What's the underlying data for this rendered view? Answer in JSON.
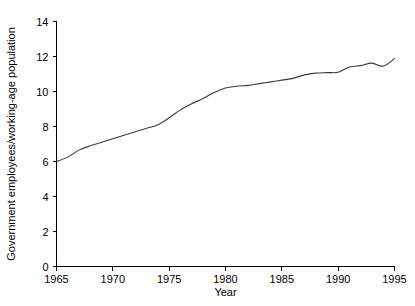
{
  "chart_data": {
    "type": "line",
    "title": "",
    "subtitle": "",
    "xlabel": "Year",
    "ylabel": "Government employees/working-age population",
    "xlim": [
      1965,
      1995
    ],
    "ylim": [
      0,
      14
    ],
    "xticks": [
      1965,
      1970,
      1975,
      1980,
      1985,
      1990,
      1995
    ],
    "xtick_labels": [
      "1965",
      "1970",
      "1975",
      "1980",
      "1985",
      "1990",
      "1995"
    ],
    "yticks": [
      0,
      2,
      4,
      6,
      8,
      10,
      12,
      14
    ],
    "ytick_labels": [
      "0",
      "2",
      "4",
      "6",
      "8",
      "10",
      "12",
      "14"
    ],
    "grid": false,
    "legend": false,
    "legend_position": "none",
    "line_color": "#3a3a3a",
    "background_color": "#ffffff",
    "axis_color": "#000000",
    "x": [
      1965,
      1966,
      1967,
      1968,
      1969,
      1970,
      1971,
      1972,
      1973,
      1974,
      1975,
      1976,
      1977,
      1978,
      1979,
      1980,
      1981,
      1982,
      1983,
      1984,
      1985,
      1986,
      1987,
      1988,
      1989,
      1990,
      1991,
      1992,
      1993,
      1994,
      1995
    ],
    "values": [
      6.0,
      6.25,
      6.65,
      6.9,
      7.1,
      7.3,
      7.5,
      7.7,
      7.9,
      8.1,
      8.5,
      8.95,
      9.3,
      9.6,
      9.95,
      10.2,
      10.3,
      10.35,
      10.45,
      10.55,
      10.65,
      10.75,
      10.95,
      11.05,
      11.08,
      11.1,
      11.4,
      11.48,
      11.62,
      11.45,
      11.88
    ],
    "series": [
      {
        "name": "Government employees/working-age population",
        "values": [
          6.0,
          6.25,
          6.65,
          6.9,
          7.1,
          7.3,
          7.5,
          7.7,
          7.9,
          8.1,
          8.5,
          8.95,
          9.3,
          9.6,
          9.95,
          10.2,
          10.3,
          10.35,
          10.45,
          10.55,
          10.65,
          10.75,
          10.95,
          11.05,
          11.08,
          11.1,
          11.4,
          11.48,
          11.62,
          11.45,
          11.88
        ]
      }
    ]
  }
}
